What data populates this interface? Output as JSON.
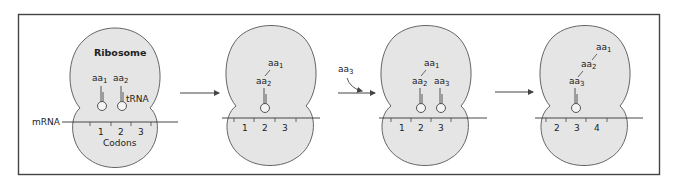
{
  "colors": {
    "ribosome_fill": "#e5e5e5",
    "outline": "#555555",
    "frame": "#444444",
    "text": "#222222"
  },
  "labels": {
    "ribosome": "Ribosome",
    "trna": "tRNA",
    "mrna": "mRNA",
    "codons": "Codons",
    "aa_prefix": "aa",
    "incoming_aa": {
      "base": "aa",
      "sub": "3"
    }
  },
  "panels": [
    {
      "step": 1,
      "codons": [
        "1",
        "2",
        "3"
      ],
      "amino_acids": [
        {
          "base": "aa",
          "sub": "1"
        },
        {
          "base": "aa",
          "sub": "2"
        }
      ],
      "trna_count": 2,
      "show_ribosome_label": true,
      "show_trna_label": true,
      "show_codons_label": true,
      "show_mrna_label": true
    },
    {
      "step": 2,
      "codons": [
        "1",
        "2",
        "3"
      ],
      "amino_acids": [
        {
          "base": "aa",
          "sub": "1"
        },
        {
          "base": "aa",
          "sub": "2"
        }
      ],
      "trna_count": 1
    },
    {
      "step": 3,
      "codons": [
        "1",
        "2",
        "3"
      ],
      "amino_acids": [
        {
          "base": "aa",
          "sub": "1"
        },
        {
          "base": "aa",
          "sub": "2"
        },
        {
          "base": "aa",
          "sub": "3"
        }
      ],
      "trna_count": 2
    },
    {
      "step": 4,
      "codons": [
        "2",
        "3",
        "4"
      ],
      "amino_acids": [
        {
          "base": "aa",
          "sub": "1"
        },
        {
          "base": "aa",
          "sub": "2"
        },
        {
          "base": "aa",
          "sub": "3"
        }
      ],
      "trna_count": 1
    }
  ],
  "arrows": [
    {
      "from_step": 1,
      "to_step": 2
    },
    {
      "from_step": 2,
      "to_step": 3,
      "incoming": "aa3"
    },
    {
      "from_step": 3,
      "to_step": 4
    }
  ]
}
